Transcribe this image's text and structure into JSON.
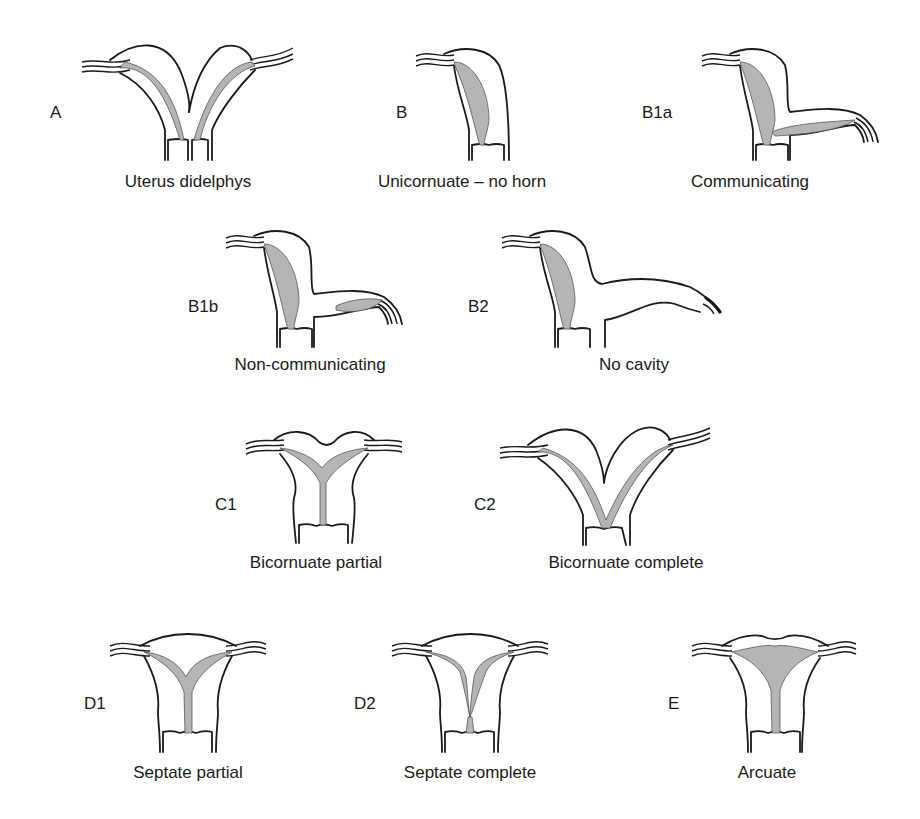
{
  "figure": {
    "panels": [
      {
        "id": "A",
        "letter": "A",
        "caption": "Uterus didelphys"
      },
      {
        "id": "B",
        "letter": "B",
        "caption": "Unicornuate – no horn"
      },
      {
        "id": "B1a",
        "letter": "B1a",
        "caption": "Communicating"
      },
      {
        "id": "B1b",
        "letter": "B1b",
        "caption": "Non-communicating"
      },
      {
        "id": "B2",
        "letter": "B2",
        "caption": "No cavity"
      },
      {
        "id": "C1",
        "letter": "C1",
        "caption": "Bicornuate partial"
      },
      {
        "id": "C2",
        "letter": "C2",
        "caption": "Bicornuate complete"
      },
      {
        "id": "D1",
        "letter": "D1",
        "caption": "Septate partial"
      },
      {
        "id": "D2",
        "letter": "D2",
        "caption": "Septate complete"
      },
      {
        "id": "E",
        "letter": "E",
        "caption": "Arcuate"
      }
    ],
    "colors": {
      "outline": "#1a1a1a",
      "cavity": "#b5b5b5",
      "background": "#ffffff"
    }
  }
}
